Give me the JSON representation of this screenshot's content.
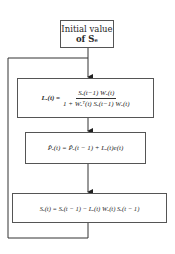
{
  "diagram": {
    "type": "flowchart",
    "nodes": [
      {
        "id": "init",
        "line1": "Initial value",
        "line2": "of Sₑ"
      },
      {
        "id": "gain",
        "lhs": "Lₑ(t) =",
        "num": "Sₑ(t−1) Wₑ(t)",
        "den": "1 + Wₑᵀ(t) Sₑ(t−1) Wₑ(t)"
      },
      {
        "id": "update_p",
        "text": "P̂ₑ(t) = P̂ₑ(t − 1) + Lₑ(t)e(t)"
      },
      {
        "id": "update_s",
        "text": "Sₑ(t) = Sₑ(t − 1) − Lₑ(t) Wₑ(t) Sₑ(t − 1)"
      }
    ],
    "edges": [
      {
        "from": "init",
        "to": "gain"
      },
      {
        "from": "gain",
        "to": "update_p"
      },
      {
        "from": "update_p",
        "to": "update_s"
      },
      {
        "from": "update_s",
        "to": "gain",
        "kind": "feedback-loop"
      }
    ],
    "colors": {
      "line": "#333333",
      "border": "#555555",
      "background": "#ffffff"
    }
  }
}
